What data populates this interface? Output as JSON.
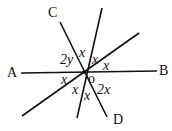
{
  "points": {
    "A": "A",
    "B": "B",
    "C": "C",
    "D": "D",
    "O": "o"
  },
  "angles": {
    "a1": "2y",
    "a2": "x",
    "a3": "x",
    "a4": "x",
    "a5": "x",
    "a6": "x",
    "a7": "x",
    "a8": "2x"
  },
  "colors": {
    "line": "#111111"
  }
}
